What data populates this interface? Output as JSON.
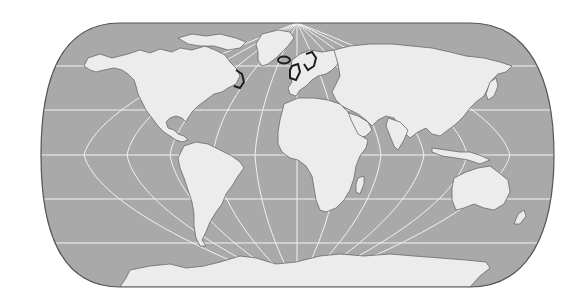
{
  "map": {
    "projection": "pseudocylindrical world map (Eckert IV style)",
    "colors": {
      "background": "#ffffff",
      "ocean": "#a9a9a9",
      "land": "#ececec",
      "coastline": "#6a6a6a",
      "graticule": "#f4f4f4",
      "border": "#555555",
      "highlight": "#1e1e1e"
    },
    "graticule": {
      "parallels_y": [
        66,
        110,
        155,
        199,
        243
      ],
      "meridian_count": 12
    },
    "highlighted_regions": [
      "Newfoundland / Nova Scotia coast",
      "Iceland",
      "British Isles",
      "Norway coast"
    ],
    "continents": [
      "North America",
      "Greenland",
      "South America",
      "Europe",
      "Africa",
      "Asia",
      "Australia",
      "Antarctica"
    ]
  }
}
